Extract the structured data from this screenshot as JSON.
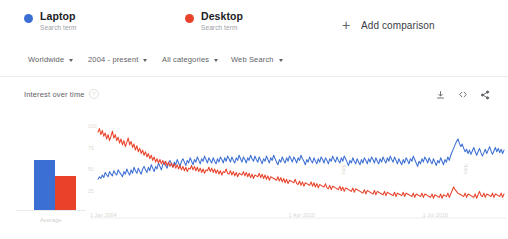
{
  "legend": {
    "items": [
      {
        "term": "Laptop",
        "subtitle": "Search term",
        "color": "#3B6FD4",
        "dot_name": "legend-dot-laptop"
      },
      {
        "term": "Desktop",
        "subtitle": "Search term",
        "color": "#E8422A",
        "dot_name": "legend-dot-desktop"
      }
    ],
    "add_comparison": {
      "label": "Add comparison",
      "plus": "+"
    }
  },
  "filters": [
    {
      "label": "Worldwide",
      "caret": "▾"
    },
    {
      "label": "2004 - present",
      "caret": "▾"
    },
    {
      "label": "All categories",
      "caret": "▾"
    },
    {
      "label": "Web Search",
      "caret": "▾"
    }
  ],
  "section": {
    "title": "Interest over time",
    "info_glyph": "?",
    "actions": [
      {
        "name": "download-icon",
        "tooltip": "Download"
      },
      {
        "name": "embed-icon",
        "tooltip": "Embed"
      },
      {
        "name": "share-icon",
        "tooltip": "Share"
      }
    ]
  },
  "chart_data": {
    "type": "line",
    "title": "Interest over time",
    "xlabel": "",
    "ylabel": "Interest",
    "ylim": [
      0,
      100
    ],
    "grid": false,
    "legend_position": "top",
    "yticks": [
      "100",
      "75",
      "50",
      "25"
    ],
    "ytick_values": [
      100,
      75,
      50,
      25
    ],
    "xticks": [
      "1 Jan 2004",
      "1 Apr 2010",
      "1 Jul 2016"
    ],
    "annotations": [
      "Note",
      "Note"
    ],
    "series": [
      {
        "name": "Laptop",
        "color": "#3B6FD4",
        "values": [
          38,
          41,
          39,
          43,
          40,
          46,
          43,
          41,
          47,
          44,
          42,
          48,
          45,
          43,
          49,
          46,
          44,
          41,
          47,
          44,
          50,
          46,
          43,
          49,
          45,
          52,
          48,
          45,
          51,
          47,
          44,
          50,
          53,
          49,
          46,
          52,
          48,
          55,
          51,
          47,
          53,
          50,
          57,
          53,
          49,
          55,
          58,
          54,
          51,
          57,
          60,
          56,
          52,
          58,
          55,
          61,
          57,
          53,
          59,
          62,
          58,
          54,
          60,
          57,
          63,
          59,
          55,
          61,
          58,
          64,
          60,
          56,
          62,
          59,
          65,
          61,
          57,
          63,
          60,
          57,
          63,
          59,
          56,
          62,
          58,
          64,
          61,
          57,
          63,
          59,
          65,
          62,
          58,
          64,
          60,
          57,
          63,
          60,
          66,
          62,
          58,
          64,
          61,
          57,
          63,
          60,
          66,
          62,
          59,
          65,
          61,
          58,
          64,
          60,
          56,
          62,
          59,
          65,
          61,
          57,
          63,
          60,
          66,
          62,
          58,
          55,
          61,
          58,
          64,
          60,
          57,
          63,
          59,
          65,
          62,
          58,
          64,
          61,
          57,
          63,
          60,
          66,
          62,
          59,
          55,
          61,
          58,
          64,
          60,
          57,
          63,
          59,
          56,
          62,
          58,
          64,
          61,
          57,
          63,
          60,
          56,
          62,
          59,
          65,
          61,
          58,
          64,
          60,
          57,
          63,
          59,
          65,
          62,
          58,
          54,
          60,
          57,
          63,
          59,
          56,
          62,
          58,
          55,
          61,
          57,
          63,
          60,
          56,
          62,
          58,
          64,
          61,
          57,
          63,
          59,
          56,
          62,
          58,
          64,
          60,
          57,
          63,
          59,
          65,
          61,
          58,
          64,
          60,
          56,
          62,
          58,
          55,
          61,
          57,
          63,
          60,
          56,
          62,
          59,
          65,
          61,
          57,
          53,
          59,
          56,
          62,
          58,
          64,
          61,
          57,
          63,
          59,
          56,
          62,
          58,
          54,
          60,
          57,
          63,
          59,
          55,
          61,
          58,
          64,
          60,
          66,
          70,
          74,
          78,
          82,
          85,
          80,
          76,
          79,
          74,
          70,
          73,
          68,
          72,
          67,
          71,
          75,
          70,
          66,
          70,
          74,
          69,
          65,
          69,
          73,
          68,
          72,
          76,
          71,
          67,
          71,
          75,
          70,
          74,
          69,
          73,
          68,
          72
        ]
      },
      {
        "name": "Desktop",
        "color": "#E8422A",
        "values": [
          93,
          97,
          90,
          95,
          88,
          92,
          85,
          90,
          83,
          88,
          94,
          86,
          90,
          83,
          87,
          80,
          85,
          78,
          83,
          76,
          81,
          86,
          78,
          82,
          75,
          79,
          72,
          77,
          70,
          74,
          68,
          72,
          66,
          70,
          64,
          68,
          62,
          66,
          60,
          64,
          58,
          62,
          57,
          61,
          56,
          60,
          55,
          59,
          54,
          58,
          53,
          57,
          52,
          56,
          51,
          55,
          50,
          54,
          49,
          53,
          48,
          52,
          47,
          51,
          50,
          54,
          49,
          53,
          48,
          52,
          47,
          51,
          46,
          50,
          45,
          49,
          48,
          52,
          47,
          51,
          46,
          50,
          45,
          49,
          44,
          48,
          43,
          47,
          46,
          50,
          45,
          44,
          48,
          43,
          47,
          42,
          46,
          41,
          45,
          44,
          43,
          47,
          42,
          46,
          41,
          45,
          40,
          44,
          39,
          43,
          42,
          41,
          45,
          40,
          44,
          39,
          43,
          38,
          42,
          37,
          41,
          40,
          39,
          38,
          37,
          41,
          36,
          40,
          35,
          39,
          34,
          38,
          33,
          37,
          36,
          35,
          34,
          38,
          33,
          32,
          36,
          31,
          35,
          30,
          34,
          33,
          32,
          31,
          35,
          30,
          34,
          29,
          33,
          28,
          32,
          31,
          30,
          29,
          33,
          28,
          27,
          31,
          26,
          30,
          29,
          28,
          27,
          26,
          30,
          25,
          29,
          24,
          28,
          27,
          26,
          25,
          24,
          28,
          23,
          27,
          26,
          25,
          24,
          23,
          22,
          26,
          21,
          25,
          24,
          23,
          22,
          21,
          25,
          20,
          24,
          23,
          22,
          21,
          20,
          24,
          19,
          23,
          22,
          21,
          20,
          19,
          23,
          18,
          22,
          21,
          20,
          19,
          23,
          18,
          22,
          21,
          20,
          19,
          18,
          22,
          17,
          21,
          20,
          19,
          18,
          22,
          17,
          21,
          20,
          19,
          18,
          17,
          21,
          16,
          20,
          19,
          18,
          17,
          21,
          16,
          20,
          19,
          18,
          22,
          17,
          21,
          25,
          29,
          26,
          24,
          22,
          21,
          20,
          19,
          18,
          22,
          17,
          21,
          20,
          19,
          18,
          17,
          21,
          16,
          20,
          24,
          19,
          18,
          22,
          17,
          21,
          20,
          19,
          18,
          22,
          17,
          21,
          20,
          19,
          18,
          22,
          17,
          21
        ]
      }
    ]
  },
  "average_chart": {
    "type": "bar",
    "label": "Average",
    "categories": [
      "Laptop",
      "Desktop"
    ],
    "values": [
      64,
      44
    ],
    "ylim": [
      0,
      100
    ],
    "colors": [
      "#3B6FD4",
      "#E8422A"
    ]
  }
}
